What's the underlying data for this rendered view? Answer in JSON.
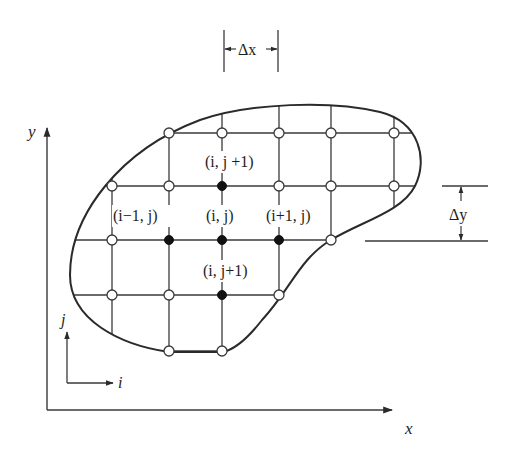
{
  "diagram": {
    "type": "finite-difference-grid",
    "colors": {
      "line": "#3a3a3a",
      "boundary": "#2a2a2a",
      "filled_node": "#111111",
      "open_node_fill": "#ffffff",
      "background": "#ffffff"
    },
    "axes": {
      "x_label": "x",
      "y_label": "y",
      "i_label": "i",
      "j_label": "j"
    },
    "spacing": {
      "dx_label": "Δx",
      "dy_label": "Δy"
    },
    "stencil_labels": {
      "top": "(i, j +1)",
      "left": "(i−1, j)",
      "center": "(i, j)",
      "right": "(i+1, j)",
      "bottom": "(i, j+1)"
    },
    "grid": {
      "columns_x": [
        112,
        169,
        222,
        279,
        331,
        394
      ],
      "rows_y": [
        133,
        186,
        240,
        295,
        351
      ],
      "filled_nodes": [
        {
          "name": "top",
          "x": 222,
          "y": 186
        },
        {
          "name": "left",
          "x": 169,
          "y": 240
        },
        {
          "name": "center",
          "x": 222,
          "y": 240
        },
        {
          "name": "right",
          "x": 279,
          "y": 240
        },
        {
          "name": "bottom",
          "x": 222,
          "y": 295
        }
      ],
      "open_nodes": [
        {
          "x": 169,
          "y": 133
        },
        {
          "x": 222,
          "y": 133
        },
        {
          "x": 279,
          "y": 133
        },
        {
          "x": 331,
          "y": 133
        },
        {
          "x": 394,
          "y": 133
        },
        {
          "x": 112,
          "y": 186
        },
        {
          "x": 169,
          "y": 186
        },
        {
          "x": 279,
          "y": 186
        },
        {
          "x": 331,
          "y": 186
        },
        {
          "x": 394,
          "y": 186
        },
        {
          "x": 112,
          "y": 240
        },
        {
          "x": 331,
          "y": 240
        },
        {
          "x": 112,
          "y": 295
        },
        {
          "x": 169,
          "y": 295
        },
        {
          "x": 279,
          "y": 295
        },
        {
          "x": 169,
          "y": 351
        },
        {
          "x": 222,
          "y": 351
        }
      ]
    }
  }
}
